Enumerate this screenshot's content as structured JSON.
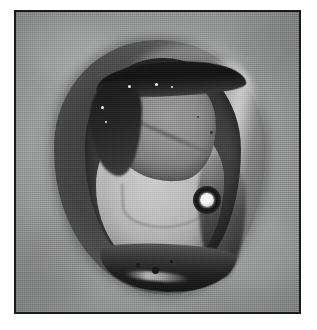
{
  "figure": {
    "kind": "photograph",
    "rendering": "grayscale halftone print",
    "title": "",
    "caption": "",
    "frame": {
      "border_color": "#1a1a1a",
      "border_width_px": 2,
      "left_px": 14,
      "top_px": 10,
      "width_px": 287,
      "height_px": 304
    },
    "page_background_color": "#ffffff"
  },
  "scene": {
    "background": {
      "name": "paper-backdrop",
      "description": "flat evenly-lit grey textured surface",
      "color": "#9a9b9b"
    },
    "subject": {
      "name": "specimen",
      "description": "dissected ovoid biological specimen shown in plan view, outer dark rind opened to reveal a pale inner mass",
      "silhouette": "vertical ovoid / egg-shaped",
      "center_px": [
        152,
        163
      ],
      "width_px": 212,
      "height_px": 255
    },
    "regions": [
      {
        "name": "outer-shell",
        "label": "dark outer rind",
        "tone": "#4a4a4a",
        "description": "dark charcoal shell surrounding the whole specimen"
      },
      {
        "name": "shell-highlight",
        "label": "specular rim highlight",
        "tone": "#efefef",
        "description": "bright crescent reflection down the right flank"
      },
      {
        "name": "cavity-wall",
        "label": "inner cavity wall",
        "tone": "#333333",
        "description": "near-black ring bounding the opened cavity"
      },
      {
        "name": "flesh-mass",
        "label": "pale inner mass",
        "tone": "#c2c2c2",
        "description": "large light-grey lobed body filling the lower half of the cavity"
      },
      {
        "name": "upper-lobe",
        "label": "upper grey lobe",
        "tone": "#8c8c8c",
        "description": "mid-grey flap of tissue folded over the upper cavity"
      },
      {
        "name": "crust-band-top",
        "label": "dark encrusted band",
        "tone": "#141414",
        "description": "black crusty band with bright mineral specks across the top of the cavity"
      },
      {
        "name": "crust-band-bottom",
        "label": "dark basal crust",
        "tone": "#1c1c1c",
        "description": "black crusty material with glint highlights along the bottom rim"
      }
    ],
    "marker": {
      "name": "bright-circular-marker",
      "label": "illuminated bead marker",
      "description": "dark annulus with a brilliant white centre, placed on the pale inner mass right of centre",
      "center_px": [
        183,
        180
      ],
      "outer_diameter_px": 28,
      "core_diameter_px": 14,
      "core_color": "#ffffff",
      "ring_color": "#0c0c0c"
    },
    "flecks": [
      {
        "name": "dark-fleck",
        "center_px": [
          150,
          258
        ],
        "size_px": 7,
        "tone": "#141414"
      },
      {
        "name": "dark-fleck",
        "center_px": [
          133,
          253
        ],
        "size_px": 4,
        "tone": "#141414"
      },
      {
        "name": "dark-fleck",
        "center_px": [
          168,
          250
        ],
        "size_px": 3,
        "tone": "#141414"
      },
      {
        "name": "dark-fleck",
        "center_px": [
          210,
          120
        ],
        "size_px": 3,
        "tone": "#1e1e1e"
      },
      {
        "name": "dark-fleck",
        "center_px": [
          196,
          105
        ],
        "size_px": 2,
        "tone": "#2a2a2a"
      },
      {
        "name": "light-speck",
        "center_px": [
          126,
          74
        ],
        "size_px": 3,
        "tone": "#f2f2f2"
      },
      {
        "name": "light-speck",
        "center_px": [
          154,
          72
        ],
        "size_px": 3,
        "tone": "#f2f2f2"
      },
      {
        "name": "light-speck",
        "center_px": [
          170,
          75
        ],
        "size_px": 2,
        "tone": "#ededed"
      },
      {
        "name": "light-speck",
        "center_px": [
          99,
          95
        ],
        "size_px": 3,
        "tone": "#ededed"
      },
      {
        "name": "light-speck",
        "center_px": [
          103,
          110
        ],
        "size_px": 2,
        "tone": "#e6e6e6"
      },
      {
        "name": "light-speck",
        "center_px": [
          268,
          72
        ],
        "size_px": 2,
        "tone": "#4a4a4a"
      }
    ],
    "palette": {
      "paper": "#9a9b9b",
      "shell_dark": "#3c3c3c",
      "cavity_dark": "#2a2a2a",
      "flesh_light": "#c8c8c8",
      "lobe_mid": "#8e8e8e",
      "highlight_white": "#ffffff",
      "crust_black": "#101010",
      "frame_border": "#1a1a1a"
    }
  }
}
